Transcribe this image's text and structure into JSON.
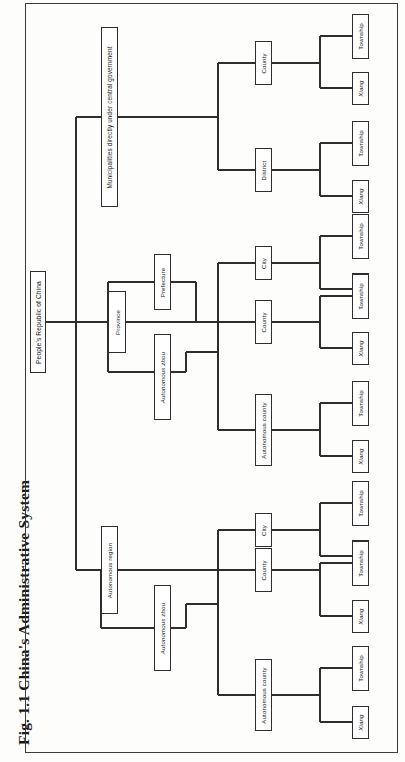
{
  "figure": {
    "caption": "Fig. 1.1  China's Administrative System",
    "caption_number": "Fig. 1.1",
    "caption_title": "China's Administrative System",
    "orientation": "rotated-90-ccw",
    "type": "hierarchy-tree",
    "frame_color": "#3a3a3a",
    "node_border_color": "#2e2e2e",
    "node_fill": "#ffffff",
    "line_color": "#2e2e2e",
    "background": "#fdfdfb"
  },
  "tree": {
    "root": {
      "label": "People's Republic of China"
    },
    "level1": [
      {
        "id": "municipalities",
        "label": "Municipalities directly under central government"
      },
      {
        "id": "province",
        "label": "Province"
      },
      {
        "id": "autonomous-region",
        "label": "Autonomous region"
      }
    ],
    "level2": [
      {
        "id": "prefecture",
        "label": "Prefecture",
        "parent": "province"
      },
      {
        "id": "autonomous-zhou-province",
        "label": "Autonomous zhou",
        "parent": "province",
        "italic": true
      },
      {
        "id": "autonomous-zhou-region",
        "label": "Autonomous zhou",
        "parent": "autonomous-region",
        "italic": true
      }
    ],
    "level3": [
      {
        "id": "m-county",
        "label": "County",
        "branch": "municipalities"
      },
      {
        "id": "m-district",
        "label": "District",
        "branch": "municipalities"
      },
      {
        "id": "p-city",
        "label": "City",
        "branch": "province"
      },
      {
        "id": "p-county",
        "label": "County",
        "branch": "province"
      },
      {
        "id": "p-autocty",
        "label": "Autonomous county",
        "branch": "province"
      },
      {
        "id": "r-city",
        "label": "City",
        "branch": "autonomous-region"
      },
      {
        "id": "r-county",
        "label": "County",
        "branch": "autonomous-region"
      },
      {
        "id": "r-autocty",
        "label": "Autonomous county",
        "branch": "autonomous-region"
      }
    ],
    "leaves": [
      {
        "id": "l1-township",
        "label": "Township",
        "parent": "m-county",
        "italic": false
      },
      {
        "id": "l1-xiang",
        "label": "Xiang",
        "parent": "m-county",
        "italic": true
      },
      {
        "id": "l2-township",
        "label": "Township",
        "parent": "m-district",
        "italic": false
      },
      {
        "id": "l2-xiang",
        "label": "Xiang",
        "parent": "m-district",
        "italic": true
      },
      {
        "id": "l3-township",
        "label": "Township",
        "parent": "p-city",
        "italic": false
      },
      {
        "id": "l3-xiang",
        "label": "Xiang",
        "parent": "p-city",
        "italic": true
      },
      {
        "id": "l4-township",
        "label": "Township",
        "parent": "p-county",
        "italic": false
      },
      {
        "id": "l4-xiang",
        "label": "Xiang",
        "parent": "p-county",
        "italic": true
      },
      {
        "id": "l5-township",
        "label": "Township",
        "parent": "p-autocty",
        "italic": false
      },
      {
        "id": "l5-xiang",
        "label": "Xiang",
        "parent": "p-autocty",
        "italic": true
      },
      {
        "id": "l6-township",
        "label": "Township",
        "parent": "r-city",
        "italic": false
      },
      {
        "id": "l6-xiang",
        "label": "Xiang",
        "parent": "r-city",
        "italic": true
      },
      {
        "id": "l7-township",
        "label": "Township",
        "parent": "r-county",
        "italic": false
      },
      {
        "id": "l7-xiang",
        "label": "Xiang",
        "parent": "r-county",
        "italic": true
      },
      {
        "id": "l8-township",
        "label": "Township",
        "parent": "r-autocty",
        "italic": false
      },
      {
        "id": "l8-xiang",
        "label": "Xiang",
        "parent": "r-autocty",
        "italic": true
      }
    ]
  }
}
